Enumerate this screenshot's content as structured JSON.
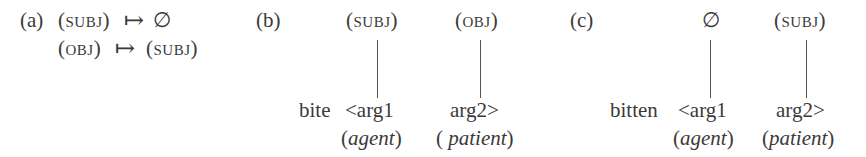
{
  "panels": {
    "a": {
      "label": "(a)",
      "rules": [
        {
          "lhs": "(subj)",
          "arrow": "↦",
          "rhs": "∅"
        },
        {
          "lhs": "(obj)",
          "arrow": "↦",
          "rhs": "(subj)"
        }
      ]
    },
    "b": {
      "label": "(b)",
      "functions": [
        "(subj)",
        "(obj)"
      ],
      "predicate": "bite",
      "args": [
        "<arg1",
        "arg2>"
      ],
      "roles": [
        "(agent)",
        "(patient)"
      ],
      "roles_parts": [
        {
          "open": "(",
          "word": "agent",
          "close": ")"
        },
        {
          "open": "(",
          "word": "patient",
          "close": ")"
        }
      ]
    },
    "c": {
      "label": "(c)",
      "functions": [
        "∅",
        "(subj)"
      ],
      "predicate": "bitten",
      "args": [
        "<arg1",
        "arg2>"
      ],
      "roles_parts": [
        {
          "open": "(",
          "word": "agent",
          "close": ")"
        },
        {
          "open": "(",
          "word": "patient",
          "close": ")"
        }
      ]
    }
  }
}
